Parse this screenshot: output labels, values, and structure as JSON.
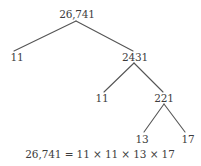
{
  "diagram": {
    "type": "factor-tree",
    "nodes": {
      "root": "26,741",
      "left_1": "11",
      "right_1": "2431",
      "left_2": "11",
      "right_2": "221",
      "left_3": "13",
      "right_3": "17"
    },
    "edges": [
      [
        "26,741",
        "11"
      ],
      [
        "26,741",
        "2431"
      ],
      [
        "2431",
        "11"
      ],
      [
        "2431",
        "221"
      ],
      [
        "221",
        "13"
      ],
      [
        "221",
        "17"
      ]
    ],
    "equation": "26,741 = 11 × 11 × 13 × 17",
    "line_color": "#555555"
  }
}
